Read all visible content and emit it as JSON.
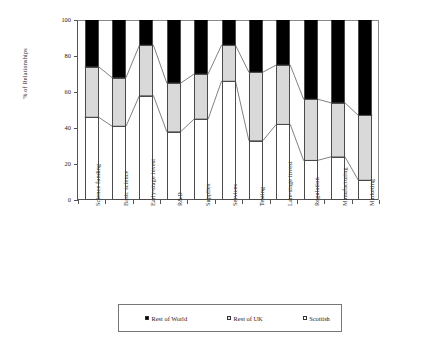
{
  "chart_data": {
    "type": "bar",
    "subtype": "stacked-column-100-percent",
    "title": "",
    "xlabel": "",
    "ylabel": "% of Relationships",
    "ylim": [
      0,
      100
    ],
    "yticks": [
      0,
      20,
      40,
      60,
      80,
      100
    ],
    "grid": false,
    "legend_position": "bottom",
    "categories": [
      "Science funding",
      "Basic science",
      "Early-stage invest",
      "R&D",
      "Supplies",
      "Services",
      "Testing",
      "Late-stage invest",
      "Regulation",
      "Manufacturing",
      "Marketing"
    ],
    "series": [
      {
        "name": "Scottish",
        "color": "#ffffff",
        "values": [
          46,
          41,
          58,
          38,
          45,
          66,
          33,
          42,
          22,
          24,
          11
        ]
      },
      {
        "name": "Rest of UK",
        "color": "#d9d9d9",
        "values": [
          28,
          27,
          28,
          27,
          25,
          20,
          38,
          33,
          34,
          30,
          36
        ]
      },
      {
        "name": "Rest of World",
        "color": "#000000",
        "values": [
          26,
          32,
          14,
          35,
          30,
          14,
          29,
          25,
          44,
          46,
          53
        ]
      }
    ],
    "cumulative_boundaries": {
      "scottish_top": [
        46,
        41,
        58,
        38,
        45,
        66,
        33,
        42,
        22,
        24,
        11
      ],
      "uk_top": [
        74,
        68,
        86,
        65,
        70,
        86,
        71,
        75,
        56,
        54,
        47
      ]
    }
  },
  "legend": {
    "items": [
      {
        "label": "Rest of World",
        "swatch": "black-square-icon"
      },
      {
        "label": "Rest of UK",
        "swatch": "gray-square-icon"
      },
      {
        "label": "Scottish",
        "swatch": "white-square-icon"
      }
    ]
  },
  "axis": {
    "y_title": "% of Relationships",
    "y_tick_labels": [
      "0",
      "20",
      "40",
      "60",
      "80",
      "100"
    ]
  }
}
